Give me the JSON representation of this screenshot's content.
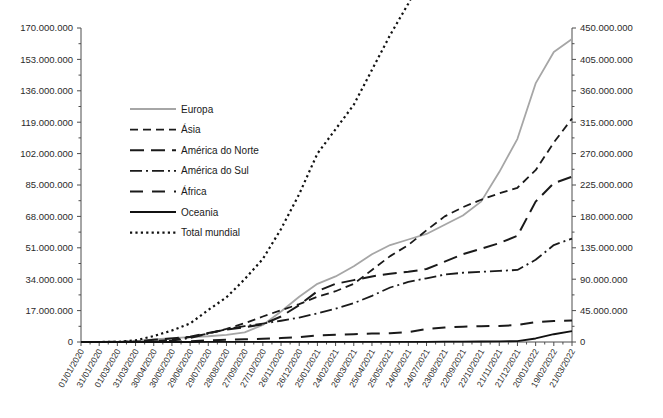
{
  "chart_data": {
    "type": "line",
    "title": "",
    "xlabel": "",
    "ylabel": "",
    "grid": false,
    "legend_position": "upper-left-inside",
    "axes": {
      "left": {
        "label": "",
        "min": 0,
        "max": 170000000,
        "step": 17000000,
        "ticks": [
          "0",
          "17.000.000",
          "34.000.000",
          "51.000.000",
          "68.000.000",
          "85.000.000",
          "102.000.000",
          "119.000.000",
          "136.000.000",
          "153.000.000",
          "170.000.000"
        ]
      },
      "right": {
        "label": "",
        "min": 0,
        "max": 450000000,
        "step": 45000000,
        "ticks": [
          "0",
          "45.000.000",
          "90.000.000",
          "135.000.000",
          "180.000.000",
          "225.000.000",
          "270.000.000",
          "315.000.000",
          "360.000.000",
          "405.000.000",
          "450.000.000"
        ]
      }
    },
    "categories": [
      "01/01/2020",
      "31/01/2020",
      "01/03/2020",
      "31/03/2020",
      "30/04/2020",
      "30/05/2020",
      "29/06/2020",
      "29/07/2020",
      "28/08/2020",
      "27/09/2020",
      "27/10/2020",
      "26/11/2020",
      "26/12/2020",
      "25/01/2021",
      "24/02/2021",
      "26/03/2021",
      "25/04/2021",
      "25/05/2021",
      "24/06/2021",
      "24/07/2021",
      "23/08/2021",
      "22/09/2021",
      "22/10/2021",
      "21/11/2021",
      "21/12/2021",
      "20/01/2022",
      "19/02/2022",
      "21/03/2022"
    ],
    "series": [
      {
        "name": "Europa",
        "axis": "left",
        "color": "#a6a6a6",
        "dash": "none",
        "width": 1.8,
        "values": [
          0,
          0,
          30000,
          460000,
          1420000,
          2080000,
          2600000,
          3100000,
          3900000,
          5200000,
          9200000,
          16500000,
          24500000,
          31500000,
          35500000,
          41000000,
          47500000,
          52500000,
          55500000,
          58500000,
          63500000,
          68500000,
          76000000,
          92000000,
          110000000,
          140000000,
          157000000,
          164000000
        ]
      },
      {
        "name": "Ásia",
        "axis": "left",
        "color": "#1a1a1a",
        "dash": "8,5",
        "width": 1.8,
        "values": [
          10000,
          12000,
          95000,
          180000,
          520000,
          1250000,
          2700000,
          4600000,
          7100000,
          10200000,
          13800000,
          17200000,
          20500000,
          24500000,
          27500000,
          31500000,
          39000000,
          46500000,
          52500000,
          60500000,
          68000000,
          73000000,
          77000000,
          80500000,
          83500000,
          93000000,
          108000000,
          121000000
        ]
      },
      {
        "name": "América do Norte",
        "axis": "left",
        "color": "#1a1a1a",
        "dash": "14,7",
        "width": 2.0,
        "values": [
          0,
          0,
          90000,
          190000,
          1180000,
          1930000,
          2850000,
          4900000,
          6700000,
          8000000,
          9600000,
          13800000,
          20000000,
          27500000,
          31500000,
          33500000,
          35500000,
          37000000,
          38000000,
          39500000,
          43500000,
          47500000,
          50500000,
          53500000,
          57500000,
          76000000,
          86000000,
          89500000
        ]
      },
      {
        "name": "América do Sul",
        "axis": "left",
        "color": "#1a1a1a",
        "dash": "12,4,2,4",
        "width": 1.8,
        "values": [
          0,
          0,
          2000,
          12000,
          140000,
          700000,
          2200000,
          4500000,
          7000000,
          8600000,
          10000000,
          11500000,
          13200000,
          15500000,
          18000000,
          21000000,
          25000000,
          29500000,
          32500000,
          34500000,
          36500000,
          37500000,
          38000000,
          38500000,
          39000000,
          44500000,
          52500000,
          56000000
        ]
      },
      {
        "name": "África",
        "axis": "left",
        "color": "#1a1a1a",
        "dash": "13,9",
        "width": 2.0,
        "values": [
          0,
          0,
          0,
          5000,
          37000,
          140000,
          390000,
          890000,
          1240000,
          1450000,
          1740000,
          2140000,
          2600000,
          3600000,
          3950000,
          4200000,
          4550000,
          4750000,
          5400000,
          7000000,
          7800000,
          8300000,
          8550000,
          8700000,
          9200000,
          10800000,
          11400000,
          11600000
        ]
      },
      {
        "name": "Oceania",
        "axis": "left",
        "color": "#111111",
        "dash": "none",
        "width": 1.8,
        "values": [
          0,
          0,
          0,
          4500,
          8000,
          8200,
          8600,
          16000,
          25500,
          27200,
          28000,
          29500,
          31000,
          32500,
          35000,
          36500,
          40000,
          45000,
          60000,
          95000,
          150000,
          210000,
          280000,
          350000,
          480000,
          1900000,
          4200000,
          5900000
        ]
      },
      {
        "name": "Total mundial",
        "axis": "right",
        "color": "#111111",
        "dash": "2.2,3.2",
        "width": 2.2,
        "values": [
          10000,
          12000,
          230000,
          2300000,
          8500000,
          16500000,
          26500000,
          46000000,
          64000000,
          90000000,
          119000000,
          162000000,
          212000000,
          270000000,
          305000000,
          340000000,
          390000000,
          440000000,
          485000000,
          535000000,
          590000000,
          635000000,
          670000000,
          700000000,
          740000000,
          835000000,
          960000000,
          1045000000
        ]
      }
    ],
    "legend": [
      {
        "label": "Europa",
        "color": "#a6a6a6",
        "dash": "none",
        "width": 1.8
      },
      {
        "label": "Ásia",
        "color": "#1a1a1a",
        "dash": "8,5",
        "width": 1.8
      },
      {
        "label": "América do Norte",
        "color": "#1a1a1a",
        "dash": "14,7",
        "width": 2.0
      },
      {
        "label": "América do Sul",
        "color": "#1a1a1a",
        "dash": "12,4,2,4",
        "width": 1.8
      },
      {
        "label": "África",
        "color": "#1a1a1a",
        "dash": "13,9",
        "width": 2.0
      },
      {
        "label": "Oceania",
        "color": "#111111",
        "dash": "none",
        "width": 1.8
      },
      {
        "label": "Total mundial",
        "color": "#111111",
        "dash": "2.2,3.2",
        "width": 2.2
      }
    ]
  }
}
